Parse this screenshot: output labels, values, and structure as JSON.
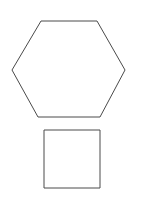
{
  "canvas": {
    "width": 144,
    "height": 199,
    "background_color": "#ffffff",
    "title": "Geometric Shapes"
  },
  "style": {
    "stroke_color": "#4a4a4a",
    "stroke_width": 1,
    "fill": "none"
  },
  "shapes": [
    {
      "id": "hexagon",
      "name": "hexagon",
      "type": "polygon",
      "sides": 6,
      "label": "Hexagon",
      "points": "41,21 97,21 125,70 100,117 38,117 12,70",
      "vertices": [
        {
          "x": 41,
          "y": 21
        },
        {
          "x": 97,
          "y": 21
        },
        {
          "x": 125,
          "y": 70
        },
        {
          "x": 100,
          "y": 117
        },
        {
          "x": 38,
          "y": 117
        },
        {
          "x": 12,
          "y": 70
        }
      ],
      "bounds": {
        "x": 12,
        "y": 21,
        "width": 113,
        "height": 96
      }
    },
    {
      "id": "square",
      "name": "square",
      "type": "rect",
      "sides": 4,
      "label": "Square",
      "points": "44,130 100,130 100,188 44,188",
      "vertices": [
        {
          "x": 44,
          "y": 130
        },
        {
          "x": 100,
          "y": 130
        },
        {
          "x": 100,
          "y": 188
        },
        {
          "x": 44,
          "y": 188
        }
      ],
      "bounds": {
        "x": 44,
        "y": 130,
        "width": 56,
        "height": 58
      }
    }
  ]
}
